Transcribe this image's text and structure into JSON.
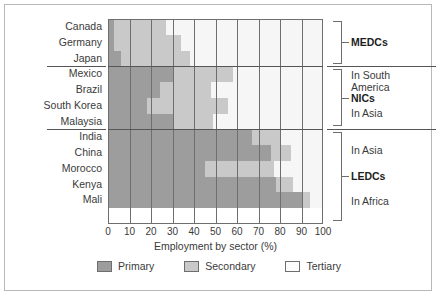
{
  "chart_data": {
    "type": "bar",
    "orientation": "horizontal",
    "stacked": true,
    "percent": true,
    "title": "",
    "xlabel": "Employment by sector (%)",
    "ylabel": "",
    "xlim": [
      0,
      100
    ],
    "xticks": [
      0,
      10,
      20,
      30,
      40,
      50,
      60,
      70,
      80,
      90,
      100
    ],
    "grid": "vertical",
    "legend_position": "bottom",
    "categories": [
      "Canada",
      "Germany",
      "Japan",
      "Mexico",
      "Brazil",
      "South Korea",
      "Malaysia",
      "India",
      "China",
      "Morocco",
      "Kenya",
      "Mali"
    ],
    "series": [
      {
        "name": "Primary",
        "color": "#9d9d9d",
        "values": [
          3,
          3,
          6,
          30,
          24,
          18,
          30,
          67,
          76,
          45,
          78,
          90
        ]
      },
      {
        "name": "Secondary",
        "color": "#c9c9c9",
        "values": [
          24,
          31,
          32,
          28,
          24,
          38,
          19,
          13,
          9,
          32,
          8,
          4
        ]
      },
      {
        "name": "Tertiary",
        "color": "#f6f6f6",
        "values": [
          73,
          66,
          62,
          42,
          52,
          44,
          51,
          20,
          15,
          23,
          14,
          6
        ]
      }
    ],
    "groups": [
      {
        "label": "MEDCs",
        "sub": [],
        "start": 0,
        "end": 3
      },
      {
        "label": "NICs",
        "sub": [
          "In South",
          "America",
          "In Asia"
        ],
        "start": 3,
        "end": 7
      },
      {
        "label": "LEDCs",
        "sub": [
          "In Asia",
          "In Africa"
        ],
        "start": 7,
        "end": 12
      }
    ]
  },
  "annotations": {
    "medcs": {
      "label": "MEDCs"
    },
    "nics": {
      "above_1": "In South",
      "above_2": "America",
      "label": "NICs",
      "below": "In Asia"
    },
    "ledcs": {
      "above": "In Asia",
      "label": "LEDCs",
      "below": "In Africa"
    }
  },
  "legend": {
    "items": [
      {
        "label": "Primary",
        "swatch": "primary-swatch"
      },
      {
        "label": "Secondary",
        "swatch": "secondary-swatch"
      },
      {
        "label": "Tertiary",
        "swatch": "tertiary-swatch"
      }
    ]
  }
}
